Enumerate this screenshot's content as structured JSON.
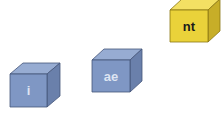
{
  "cubes": [
    {
      "id": "cube-i",
      "label": "i",
      "x": 10,
      "y": 74,
      "w": 37,
      "h": 33,
      "dx": 13,
      "dy": 11,
      "face": "#7f97c4",
      "top": "#97acd2",
      "side": "#6a80ab",
      "edge": "#45557a",
      "text_color": "#dde4f2"
    },
    {
      "id": "cube-ae",
      "label": "ae",
      "x": 92,
      "y": 60,
      "w": 38,
      "h": 32,
      "dx": 12,
      "dy": 11,
      "face": "#7f97c4",
      "top": "#97acd2",
      "side": "#6a80ab",
      "edge": "#45557a",
      "text_color": "#dde4f2"
    },
    {
      "id": "cube-nt",
      "label": "nt",
      "x": 170,
      "y": 10,
      "w": 38,
      "h": 32,
      "dx": 12,
      "dy": 11,
      "face": "#ead23a",
      "top": "#f3e063",
      "side": "#c7ae28",
      "edge": "#8a7612",
      "text_color": "#1a1a1a"
    }
  ]
}
